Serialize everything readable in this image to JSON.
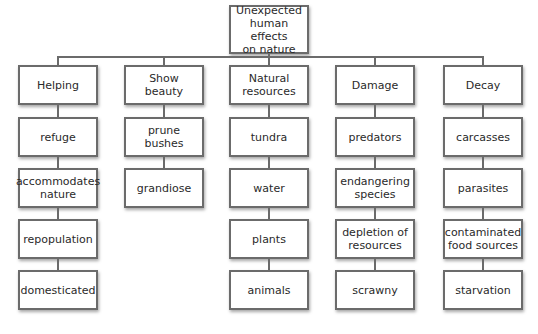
{
  "diagram": {
    "root": {
      "label": "Unexpected human effects on nature",
      "lines": [
        "Unexpected",
        "human effects",
        "on nature"
      ]
    },
    "columns": [
      {
        "header": [
          "Helping"
        ],
        "items": [
          [
            "refuge"
          ],
          [
            "accommodates",
            "nature"
          ],
          [
            "repopulation"
          ],
          [
            "domesticated"
          ]
        ]
      },
      {
        "header": [
          "Show",
          "beauty"
        ],
        "items": [
          [
            "prune bushes"
          ],
          [
            "grandiose"
          ]
        ]
      },
      {
        "header": [
          "Natural",
          "resources"
        ],
        "items": [
          [
            "tundra"
          ],
          [
            "water"
          ],
          [
            "plants"
          ],
          [
            "animals"
          ]
        ]
      },
      {
        "header": [
          "Damage"
        ],
        "items": [
          [
            "predators"
          ],
          [
            "endangering",
            "species"
          ],
          [
            "depletion of",
            "resources"
          ],
          [
            "scrawny"
          ]
        ]
      },
      {
        "header": [
          "Decay"
        ],
        "items": [
          [
            "carcasses"
          ],
          [
            "parasites"
          ],
          [
            "contaminated",
            "food sources"
          ],
          [
            "starvation"
          ]
        ]
      }
    ]
  },
  "colors": {
    "border": "#6b6b6b",
    "background": "#ffffff",
    "text": "#2a2a2a"
  }
}
